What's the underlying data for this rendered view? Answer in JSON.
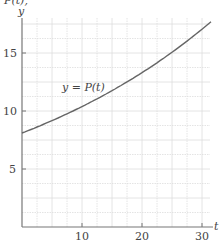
{
  "title_fragment": "P(t),",
  "chart_data": {
    "type": "line",
    "title": "",
    "xlabel": "t",
    "ylabel": "y",
    "xlim": [
      0,
      32
    ],
    "ylim": [
      0,
      18
    ],
    "grid": true,
    "x_ticks": [
      "10",
      "20",
      "30"
    ],
    "y_ticks": [
      "5",
      "10",
      "15"
    ],
    "annotation": "y = P(t)",
    "series": [
      {
        "name": "y = P(t)",
        "x": [
          0,
          5,
          10,
          15,
          20,
          25,
          30,
          31.5
        ],
        "y": [
          8.1,
          9.2,
          10.4,
          11.8,
          13.3,
          15.1,
          17.1,
          17.7
        ]
      }
    ]
  }
}
